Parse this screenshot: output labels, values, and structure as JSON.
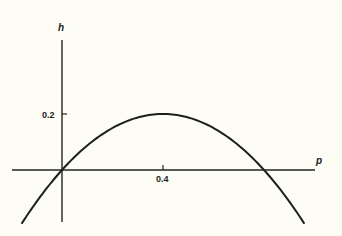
{
  "chart_data": {
    "type": "line",
    "title": "",
    "xlabel": "p",
    "ylabel": "h",
    "x_ticks": [
      {
        "value": 0.4,
        "label": "0.4"
      }
    ],
    "y_ticks": [
      {
        "value": 0.2,
        "label": "0.2"
      }
    ],
    "xlim": [
      -0.2,
      1.0
    ],
    "ylim": [
      -0.2,
      0.46
    ],
    "grid": false,
    "legend": null,
    "series": [
      {
        "name": "h(p)",
        "description": "downward parabola through origin, max h=0.2 at p=0.4, zero at p=0 and p=0.8",
        "x": [
          -0.16,
          0.0,
          0.1,
          0.2,
          0.3,
          0.4,
          0.5,
          0.6,
          0.7,
          0.8,
          0.96
        ],
        "y": [
          -0.192,
          0.0,
          0.0875,
          0.15,
          0.1875,
          0.2,
          0.1875,
          0.15,
          0.0875,
          0.0,
          -0.192
        ]
      }
    ],
    "color": "#1e1e1e"
  },
  "labels": {
    "x_axis": "p",
    "y_axis": "h",
    "x_tick": "0.4",
    "y_tick": "0.2"
  }
}
